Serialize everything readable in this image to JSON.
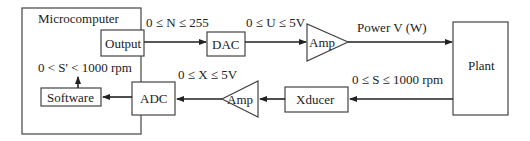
{
  "diagram": {
    "blocks": {
      "microcomputer": "Microcomputer",
      "output": "Output",
      "dac": "DAC",
      "amp_forward": "Amp",
      "plant": "Plant",
      "xducer": "Xducer",
      "amp_feedback": "Amp",
      "adc": "ADC",
      "software": "Software"
    },
    "signals": {
      "n_range": "0 ≤ N ≤ 255",
      "u_range": "0 ≤ U ≤ 5V",
      "power": "Power V (W)",
      "s_range": "0 ≤ S ≤ 1000 rpm",
      "x_range": "0 ≤ X ≤ 5V",
      "s_prime_range": "0 < S' < 1000 rpm"
    },
    "colors": {
      "stroke": "#222222",
      "background": "#ffffff"
    }
  }
}
